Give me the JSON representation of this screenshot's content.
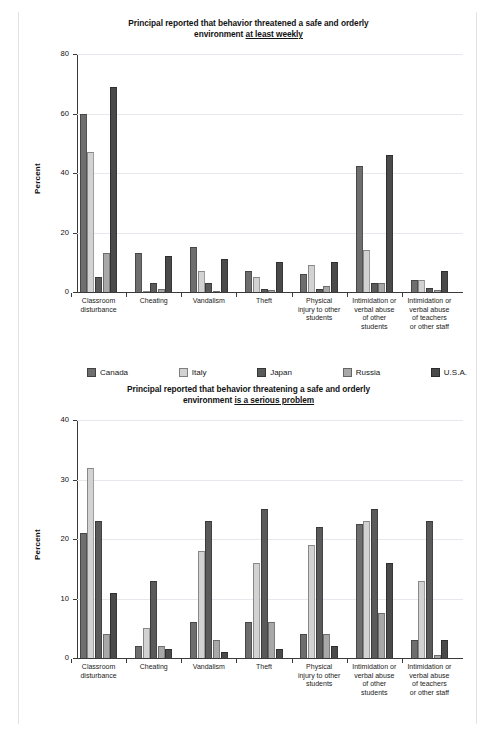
{
  "page": {
    "top_note": "",
    "background": "#ffffff"
  },
  "legend": {
    "items": [
      {
        "label": "Canada",
        "color": "#6e6e6e"
      },
      {
        "label": "Italy",
        "color": "#d2d2d2"
      },
      {
        "label": "Japan",
        "color": "#5a5a5a"
      },
      {
        "label": "Russia",
        "color": "#a8a8a8"
      },
      {
        "label": "U.S.A.",
        "color": "#4a4a4a"
      }
    ]
  },
  "chart_data": [
    {
      "type": "bar",
      "title": "Principal reported that behavior threatened a safe and orderly environment at least weekly",
      "title_line1": "Principal reported that behavior threatened a safe and orderly",
      "title_line2_plain": "environment ",
      "title_line2_underlined": "at least weekly",
      "xlabel": "",
      "ylabel": "Percent",
      "ylim": [
        0,
        80
      ],
      "yticks": [
        0,
        20,
        40,
        60,
        80
      ],
      "ytick_labels": [
        "0",
        "20",
        "40",
        "60",
        "80"
      ],
      "grid": true,
      "legend_position": "below",
      "categories": [
        "Classroom disturbance",
        "Cheating",
        "Vandalism",
        "Theft",
        "Physical injury to other students",
        "Intimidation or verbal abuse of other students",
        "Intimidation or verbal abuse of teachers or other staff"
      ],
      "category_lines": [
        [
          "Classroom",
          "disturbance"
        ],
        [
          "Cheating"
        ],
        [
          "Vandalism"
        ],
        [
          "Theft"
        ],
        [
          "Physical",
          "injury to other",
          "students"
        ],
        [
          "Intimidation or",
          "verbal abuse",
          "of other",
          "students"
        ],
        [
          "Intimidation or",
          "verbal abuse",
          "of teachers",
          "or other staff"
        ]
      ],
      "series": [
        {
          "name": "Canada",
          "color": "#6e6e6e",
          "values": [
            60,
            13,
            15,
            7,
            6,
            42.5,
            4
          ]
        },
        {
          "name": "Italy",
          "color": "#d2d2d2",
          "values": [
            47,
            0.3,
            7,
            5,
            9,
            14,
            4
          ]
        },
        {
          "name": "Japan",
          "color": "#5a5a5a",
          "values": [
            5,
            3,
            3,
            1,
            1,
            3,
            1.5
          ]
        },
        {
          "name": "Russia",
          "color": "#a8a8a8",
          "values": [
            13,
            1,
            0.4,
            0.6,
            2,
            3,
            0.6
          ]
        },
        {
          "name": "U.S.A.",
          "color": "#4a4a4a",
          "values": [
            69,
            12,
            11,
            10,
            10,
            46,
            7
          ]
        }
      ]
    },
    {
      "type": "bar",
      "title": "Principal reported that behavior threatening a safe and orderly environment is a serious problem",
      "title_line1": "Principal reported that behavior threatening a safe and orderly",
      "title_line2_plain": "environment ",
      "title_line2_underlined": "is a serious problem",
      "xlabel": "",
      "ylabel": "Percent",
      "ylim": [
        0,
        40
      ],
      "yticks": [
        0,
        10,
        20,
        30,
        40
      ],
      "ytick_labels": [
        "0",
        "10",
        "20",
        "30",
        "40"
      ],
      "grid": true,
      "legend_position": "none",
      "categories": [
        "Classroom disturbance",
        "Cheating",
        "Vandalism",
        "Theft",
        "Physical injury to other students",
        "Intimidation or verbal abuse of other students",
        "Intimidation or verbal abuse of teachers or other staff"
      ],
      "category_lines": [
        [
          "Classroom",
          "disturbance"
        ],
        [
          "Cheating"
        ],
        [
          "Vandalism"
        ],
        [
          "Theft"
        ],
        [
          "Physical",
          "injury to other",
          "students"
        ],
        [
          "Intimidation or",
          "verbal abuse",
          "of other",
          "students"
        ],
        [
          "Intimidation or",
          "verbal abuse",
          "of teachers",
          "or other staff"
        ]
      ],
      "series": [
        {
          "name": "Canada",
          "color": "#6e6e6e",
          "values": [
            21,
            2,
            6,
            6,
            4,
            22.5,
            3
          ]
        },
        {
          "name": "Italy",
          "color": "#d2d2d2",
          "values": [
            32,
            5,
            18,
            16,
            19,
            23,
            13
          ]
        },
        {
          "name": "Japan",
          "color": "#5a5a5a",
          "values": [
            23,
            13,
            23,
            25,
            22,
            25,
            23
          ]
        },
        {
          "name": "Russia",
          "color": "#a8a8a8",
          "values": [
            4,
            2,
            3,
            6,
            4,
            7.5,
            0.5
          ]
        },
        {
          "name": "U.S.A.",
          "color": "#4a4a4a",
          "values": [
            11,
            1.5,
            1,
            1.5,
            2,
            16,
            3
          ]
        }
      ]
    }
  ]
}
